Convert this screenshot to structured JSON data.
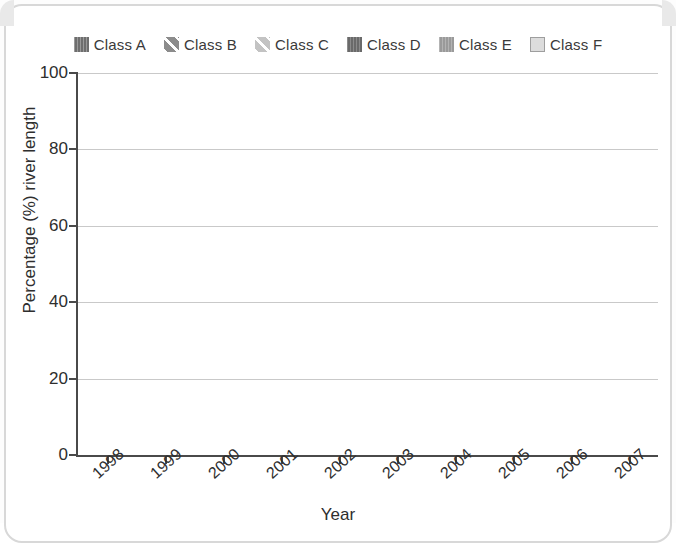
{
  "chart_data": {
    "type": "bar",
    "subtype": "stacked-bar-100",
    "title": "",
    "xlabel": "Year",
    "ylabel": "Percentage (%) river length",
    "ylim": [
      0,
      100
    ],
    "yticks": [
      0,
      20,
      40,
      60,
      80,
      100
    ],
    "grid": true,
    "legend_position": "top",
    "categories": [
      "1998",
      "1999",
      "2000",
      "2001",
      "2002",
      "2003",
      "2004",
      "2005",
      "2006",
      "2007"
    ],
    "series": [
      {
        "name": "Class A",
        "color": "#6e6e6e",
        "pattern": "vertical-lines",
        "values": [
          29,
          22,
          24,
          20,
          21,
          15,
          13,
          14.5,
          16,
          19.5
        ]
      },
      {
        "name": "Class B",
        "color": "#8c8c8c",
        "pattern": "diagonal-hatch-dark",
        "values": [
          44,
          40,
          37,
          37,
          36,
          42,
          38,
          41,
          37,
          39
        ]
      },
      {
        "name": "Class C",
        "color": "#c3c3c3",
        "pattern": "diagonal-hatch-light",
        "values": [
          21,
          22,
          21.5,
          26,
          29,
          29,
          33,
          30,
          34,
          28.5
        ]
      },
      {
        "name": "Class D",
        "color": "#6a6a6a",
        "pattern": "solid-dark",
        "values": [
          6,
          16,
          17.5,
          17,
          14,
          14,
          16,
          14.5,
          13,
          13
        ]
      },
      {
        "name": "Class E",
        "color": "#9a9a9a",
        "pattern": "solid-mid",
        "values": [
          0,
          0,
          0,
          0,
          0,
          0,
          0,
          0,
          0,
          0
        ]
      },
      {
        "name": "Class F",
        "color": "#dcdcdc",
        "pattern": "solid-light",
        "values": [
          0,
          0,
          0,
          0,
          0,
          0,
          0,
          0,
          0,
          0
        ]
      }
    ],
    "cumulative_tops": [
      [
        29,
        73,
        94,
        100,
        100,
        100
      ],
      [
        22,
        62,
        84,
        100,
        100,
        100
      ],
      [
        24,
        61,
        82.5,
        100,
        100,
        100
      ],
      [
        20,
        57,
        83,
        100,
        100,
        100
      ],
      [
        21,
        57,
        86,
        100,
        100,
        100
      ],
      [
        15,
        57,
        86,
        100,
        100,
        100
      ],
      [
        13,
        51,
        84,
        100,
        100,
        100
      ],
      [
        14.5,
        55.5,
        85.5,
        100,
        100,
        100
      ],
      [
        16,
        53,
        87,
        100,
        100,
        100
      ],
      [
        19.5,
        58.5,
        87,
        100,
        100,
        100
      ]
    ]
  },
  "legend": {
    "items": [
      {
        "label": "Class A",
        "swatch": "classA"
      },
      {
        "label": "Class B",
        "swatch": "classB"
      },
      {
        "label": "Class C",
        "swatch": "classC"
      },
      {
        "label": "Class D",
        "swatch": "classD"
      },
      {
        "label": "Class E",
        "swatch": "classE"
      },
      {
        "label": "Class F",
        "swatch": "classF"
      }
    ]
  },
  "axes": {
    "y_title": "Percentage (%) river length",
    "x_title": "Year",
    "y_tick_labels": [
      "0",
      "20",
      "40",
      "60",
      "80",
      "100"
    ],
    "x_tick_labels": [
      "1998",
      "1999",
      "2000",
      "2001",
      "2002",
      "2003",
      "2004",
      "2005",
      "2006",
      "2007"
    ]
  }
}
